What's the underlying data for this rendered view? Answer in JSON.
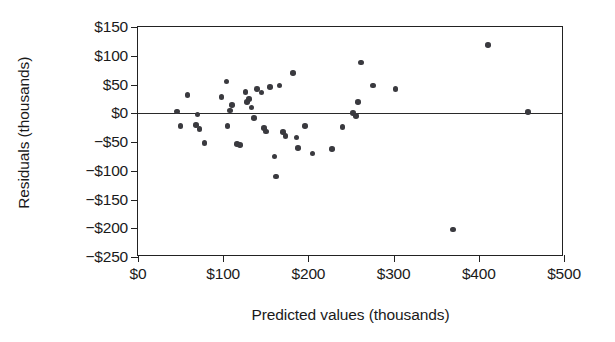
{
  "chart_data": {
    "type": "scatter",
    "title": "",
    "xlabel": "Predicted values (thousands)",
    "ylabel": "Residuals (thousands)",
    "xlim": [
      0,
      500
    ],
    "ylim": [
      -250,
      150
    ],
    "xticks": [
      0,
      100,
      200,
      300,
      400,
      500
    ],
    "xticklabels": [
      "$0",
      "$100",
      "$200",
      "$300",
      "$400",
      "$500"
    ],
    "yticks": [
      150,
      100,
      50,
      0,
      -50,
      -100,
      -150,
      -200,
      -250
    ],
    "yticklabels": [
      "$150",
      "$100",
      "$50",
      "$0",
      "−$50",
      "−$100",
      "−$150",
      "−$200",
      "−$250"
    ],
    "grid": false,
    "legend": null,
    "reference_line": {
      "y": 0,
      "color": "#2a2a2a"
    },
    "marker": {
      "shape": "circle",
      "color": "#3a3a3f",
      "size": 5.6
    },
    "points": [
      {
        "x": 46,
        "y": 3
      },
      {
        "x": 50,
        "y": -22
      },
      {
        "x": 58,
        "y": 32
      },
      {
        "x": 68,
        "y": -20
      },
      {
        "x": 70,
        "y": -2
      },
      {
        "x": 72,
        "y": -27
      },
      {
        "x": 78,
        "y": -52
      },
      {
        "x": 98,
        "y": 28
      },
      {
        "x": 104,
        "y": 55
      },
      {
        "x": 105,
        "y": -22
      },
      {
        "x": 108,
        "y": 5
      },
      {
        "x": 110,
        "y": 14
      },
      {
        "x": 116,
        "y": -53
      },
      {
        "x": 120,
        "y": -55
      },
      {
        "x": 126,
        "y": 37
      },
      {
        "x": 128,
        "y": 20
      },
      {
        "x": 130,
        "y": 25
      },
      {
        "x": 133,
        "y": 10
      },
      {
        "x": 136,
        "y": -8
      },
      {
        "x": 140,
        "y": 42
      },
      {
        "x": 145,
        "y": 36
      },
      {
        "x": 148,
        "y": -26
      },
      {
        "x": 150,
        "y": -32
      },
      {
        "x": 155,
        "y": 46
      },
      {
        "x": 160,
        "y": -75
      },
      {
        "x": 162,
        "y": -110
      },
      {
        "x": 166,
        "y": 48
      },
      {
        "x": 170,
        "y": -33
      },
      {
        "x": 173,
        "y": -40
      },
      {
        "x": 182,
        "y": 70
      },
      {
        "x": 186,
        "y": -42
      },
      {
        "x": 188,
        "y": -60
      },
      {
        "x": 196,
        "y": -22
      },
      {
        "x": 205,
        "y": -70
      },
      {
        "x": 228,
        "y": -62
      },
      {
        "x": 240,
        "y": -24
      },
      {
        "x": 252,
        "y": 0
      },
      {
        "x": 256,
        "y": -5
      },
      {
        "x": 258,
        "y": 20
      },
      {
        "x": 262,
        "y": 88
      },
      {
        "x": 276,
        "y": 48
      },
      {
        "x": 302,
        "y": 42
      },
      {
        "x": 370,
        "y": -202
      },
      {
        "x": 411,
        "y": 119
      },
      {
        "x": 458,
        "y": 2
      }
    ]
  }
}
